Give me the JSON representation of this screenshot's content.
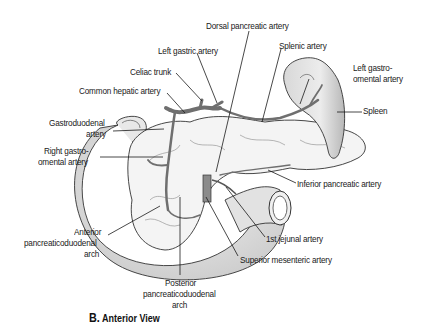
{
  "figure": {
    "caption_letter": "B.",
    "caption_text": "Anterior View",
    "colors": {
      "ink": "#1a1a1a",
      "organ_fill": "#e4e4e4",
      "organ_shade": "#c8c8c8",
      "vessel": "#8a8a8a",
      "background": "#ffffff"
    }
  },
  "labels": {
    "dorsal_pancreatic": "Dorsal pancreatic artery",
    "left_gastric": "Left gastric artery",
    "splenic": "Splenic artery",
    "celiac_trunk": "Celiac trunk",
    "common_hepatic": "Common hepatic artery",
    "left_gastroomental_1": "Left gastro-",
    "left_gastroomental_2": "omental artery",
    "spleen": "Spleen",
    "gastroduodenal_1": "Gastroduodenal",
    "gastroduodenal_2": "artery",
    "right_gastroomental_1": "Right gastro-",
    "right_gastroomental_2": "omental artery",
    "inferior_pancreatic": "Inferior pancreatic artery",
    "anterior_pd_1": "Anterior",
    "anterior_pd_2": "pancreaticoduodenal",
    "anterior_pd_3": "arch",
    "first_jejunal": "1st jejunal artery",
    "superior_mesenteric": "Superior mesenteric artery",
    "posterior_pd_1": "Posterior",
    "posterior_pd_2": "pancreaticoduodenal",
    "posterior_pd_3": "arch"
  }
}
